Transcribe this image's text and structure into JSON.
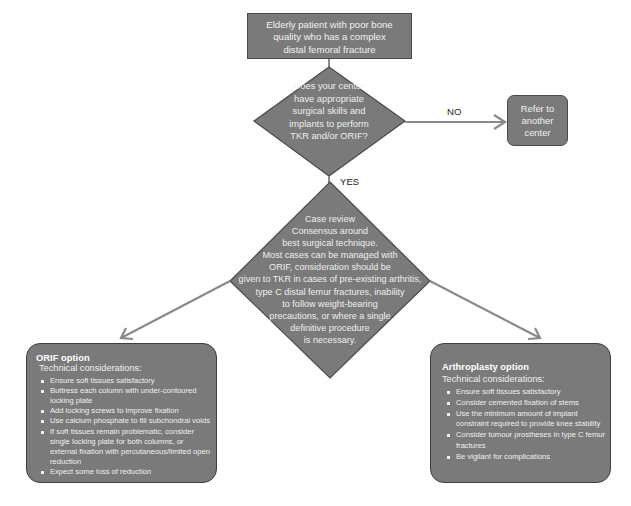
{
  "start": {
    "lines": [
      "Elderly patient with poor bone",
      "quality who has a complex",
      "distal femoral fracture"
    ]
  },
  "decision1": {
    "lines": [
      "Does your center",
      "have appropriate",
      "surgical skills and",
      "implants to perform",
      "TKR and/or ORIF?"
    ]
  },
  "edge_no": {
    "label": "NO"
  },
  "edge_yes": {
    "label": "YES"
  },
  "refer": {
    "lines": [
      "Refer to",
      "another",
      "center"
    ]
  },
  "decision2": {
    "lines": [
      "Case review",
      "Consensus around",
      "best surgical technique.",
      "Most cases can be managed with",
      "ORIF, consideration should be",
      "given to TKR in cases of pre-existing arthritis,",
      "type C distal femur fractures, inability",
      "to follow weight-bearing",
      "precautions, or where a single",
      "definitive procedure",
      "is necessary."
    ]
  },
  "orif": {
    "title": "ORIF option",
    "subtitle": "Technical considerations:",
    "bullets": [
      "Ensure soft tissues satisfactory",
      "Buttress each column with under-contoured locking plate",
      "Add locking screws to improve fixation",
      "Use calcium phosphate to fill subchondral voids",
      "If soft tissues remain problematic, consider single locking plate for both columns, or external fixation with percutaneous/limited open reduction",
      "Expect some loss of reduction"
    ]
  },
  "arthroplasty": {
    "title": "Arthroplasty option",
    "subtitle": "Technical considerations:",
    "bullets": [
      "Ensure soft tissues satisfactory",
      "Consider cemented fixation of stems",
      "Use the minimum amount of implant constraint required to provide knee stability",
      "Consider tumour prostheses in type C femur fractures",
      "Be vigilant for complications"
    ]
  },
  "colors": {
    "node_fill": "#7a7a7a",
    "node_border": "#4a4a4a",
    "arrow": "#8a8a8a",
    "node_text": "#f0f0f0",
    "label_text": "#222222"
  }
}
